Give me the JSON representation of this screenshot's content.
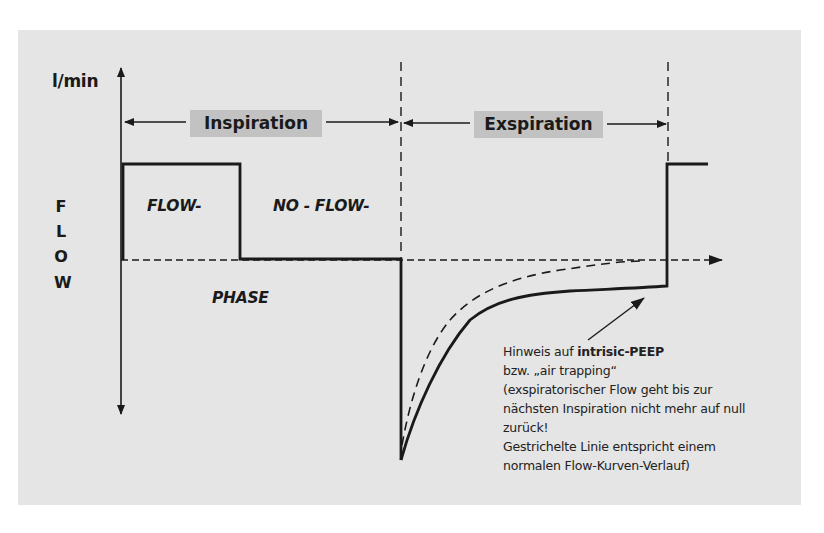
{
  "diagram": {
    "y_axis_unit": "l/min",
    "y_axis_title_letters": [
      "F",
      "L",
      "O",
      "W"
    ],
    "phases": {
      "inspiration_label": "Inspiration",
      "expiration_label": "Exspiration"
    },
    "region_labels": {
      "flow": "FLOW-",
      "no_flow": "NO - FLOW-",
      "phase": "PHASE"
    },
    "annotation": {
      "line1_prefix": "Hinweis auf ",
      "line1_bold": "intrisic-PEEP",
      "line2": "bzw. „air trapping“",
      "line3": "(exspiratorischer Flow geht bis zur",
      "line4": "nächsten Inspiration nicht mehr auf null",
      "line5": "zurück!",
      "line6": "Gestrichelte Linie entspricht einem",
      "line7": "normalen Flow-Kurven-Verlauf)"
    },
    "colors": {
      "panel_background": "#e5e5e5",
      "label_box": "#c2c2c2",
      "ink": "#1a1a1a"
    }
  }
}
